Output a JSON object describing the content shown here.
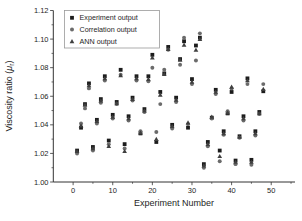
{
  "chart_data": {
    "type": "scatter",
    "title": "",
    "xlabel": "Experiment Number",
    "ylabel": "Viscosity ratio (μr)",
    "ylabel_parts": {
      "pre": "Viscosity ratio (",
      "symbol": "μ",
      "subscript": "r",
      "post": ")"
    },
    "xlim": [
      -5,
      56
    ],
    "ylim": [
      1.0,
      1.12
    ],
    "xticks": [
      0,
      10,
      20,
      30,
      40,
      50
    ],
    "yticks": [
      1.0,
      1.02,
      1.04,
      1.06,
      1.08,
      1.1,
      1.12
    ],
    "yticklabels": [
      "1.00",
      "1.02",
      "1.04",
      "1.06",
      "1.08",
      "1.10",
      "1.12"
    ],
    "x_minor_ticks": [
      5,
      15,
      25,
      35,
      45,
      55
    ],
    "y_minor_ticks": [
      1.01,
      1.03,
      1.05,
      1.07,
      1.09,
      1.11
    ],
    "grid": false,
    "legend_position": "top-left",
    "x": [
      1,
      2,
      3,
      4,
      5,
      6,
      7,
      8,
      9,
      10,
      11,
      12,
      13,
      14,
      15,
      16,
      17,
      18,
      19,
      20,
      21,
      22,
      23,
      24,
      25,
      26,
      27,
      28,
      29,
      30,
      31,
      32,
      33,
      34,
      35,
      36,
      37,
      38,
      39,
      40,
      41,
      42,
      43,
      44,
      45,
      46,
      47,
      48
    ],
    "series": [
      {
        "name": "Experiment output",
        "marker": "square",
        "color": "#1c1c1c",
        "values": [
          1.022,
          1.038,
          1.0545,
          1.069,
          1.0245,
          1.0435,
          1.058,
          1.074,
          1.029,
          1.047,
          1.056,
          1.0785,
          1.0265,
          1.046,
          1.059,
          1.074,
          1.034,
          1.051,
          1.074,
          1.089,
          1.028,
          1.063,
          1.076,
          1.0945,
          1.04,
          1.059,
          1.086,
          1.0985,
          1.038,
          1.072,
          1.0955,
          1.101,
          1.0125,
          1.028,
          1.045,
          1.0645,
          1.022,
          1.0355,
          1.048,
          1.063,
          1.015,
          1.032,
          1.046,
          1.0725,
          1.0155,
          1.0355,
          1.049,
          1.0635
        ]
      },
      {
        "name": "Correlation output",
        "marker": "circle",
        "color": "#6b6b6b",
        "values": [
          1.02,
          1.041,
          1.0515,
          1.0655,
          1.022,
          1.041,
          1.0555,
          1.071,
          1.0265,
          1.0445,
          1.0545,
          1.075,
          1.0235,
          1.043,
          1.057,
          1.071,
          1.0355,
          1.049,
          1.0705,
          1.08,
          1.035,
          1.0545,
          1.0785,
          1.0925,
          1.0375,
          1.056,
          1.082,
          1.101,
          1.0405,
          1.0685,
          1.085,
          1.104,
          1.01,
          1.025,
          1.0445,
          1.0615,
          1.0145,
          1.033,
          1.0495,
          1.0655,
          1.0125,
          1.031,
          1.043,
          1.0685,
          1.012,
          1.0325,
          1.0475,
          1.0685
        ]
      },
      {
        "name": "ANN output",
        "marker": "triangle",
        "color": "#3f3f3f",
        "values": [
          1.0215,
          1.0395,
          1.054,
          1.0675,
          1.0235,
          1.0425,
          1.057,
          1.0725,
          1.025,
          1.0455,
          1.055,
          1.0745,
          1.0215,
          1.0445,
          1.058,
          1.0725,
          1.0345,
          1.05,
          1.072,
          1.087,
          1.03,
          1.061,
          1.0755,
          1.093,
          1.039,
          1.0575,
          1.0855,
          1.096,
          1.0415,
          1.07,
          1.0925,
          1.1,
          1.0115,
          1.0265,
          1.0455,
          1.063,
          1.018,
          1.034,
          1.0485,
          1.0665,
          1.014,
          1.0315,
          1.0445,
          1.071,
          1.014,
          1.034,
          1.048,
          1.065
        ]
      }
    ]
  }
}
